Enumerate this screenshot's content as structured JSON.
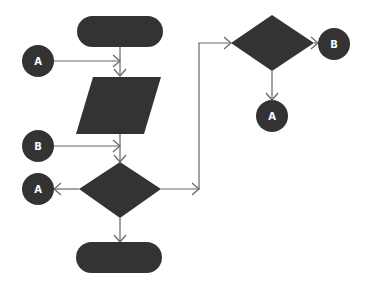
{
  "diagram": {
    "type": "flowchart",
    "colors": {
      "shape": "#333333",
      "line": "#666666",
      "label": "#ffffff",
      "background": "#ffffff"
    },
    "nodes": [
      {
        "id": "start-terminator",
        "shape": "terminator",
        "label": ""
      },
      {
        "id": "connector-a-in",
        "shape": "circle",
        "label": "A"
      },
      {
        "id": "input-output",
        "shape": "parallelogram",
        "label": ""
      },
      {
        "id": "connector-b-in",
        "shape": "circle",
        "label": "B"
      },
      {
        "id": "decision-1",
        "shape": "diamond",
        "label": ""
      },
      {
        "id": "connector-a-out",
        "shape": "circle",
        "label": "A"
      },
      {
        "id": "end-terminator",
        "shape": "terminator",
        "label": ""
      },
      {
        "id": "decision-2",
        "shape": "diamond",
        "label": ""
      },
      {
        "id": "connector-b-out",
        "shape": "circle",
        "label": "B"
      },
      {
        "id": "connector-a-out-2",
        "shape": "circle",
        "label": "A"
      }
    ],
    "edges": [
      {
        "from": "start-terminator",
        "to": "input-output"
      },
      {
        "from": "connector-a-in",
        "to": "input-output"
      },
      {
        "from": "input-output",
        "to": "decision-1"
      },
      {
        "from": "connector-b-in",
        "to": "decision-1"
      },
      {
        "from": "decision-1",
        "to": "connector-a-out"
      },
      {
        "from": "decision-1",
        "to": "end-terminator"
      },
      {
        "from": "decision-1",
        "to": "decision-2"
      },
      {
        "from": "decision-2",
        "to": "connector-b-out"
      },
      {
        "from": "decision-2",
        "to": "connector-a-out-2"
      }
    ]
  }
}
